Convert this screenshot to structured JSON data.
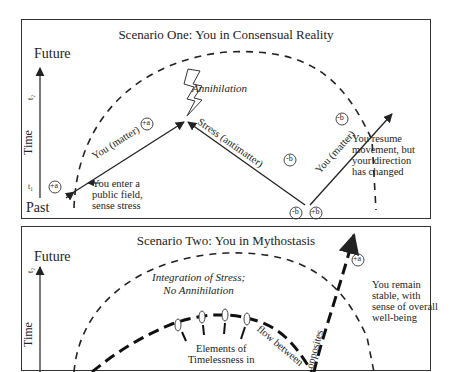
{
  "scenario_one": {
    "title": "Scenario One: You in Consensual Reality",
    "axis": {
      "top": "Future",
      "bottom": "Past",
      "label": "Time",
      "t1": "t₁",
      "t2": "t₂"
    },
    "labels": {
      "annihilation": "Annihilation",
      "you_matter_1": "You (matter)",
      "stress_antimatter": "Stress (antimatter)",
      "you_matter_2": "You (matter)",
      "plus_a": "+a",
      "minus_b": "-b",
      "plus_b": "+b"
    },
    "notes": {
      "enter": [
        "You enter a",
        "public field,",
        "sense stress"
      ],
      "resume": [
        "You resume",
        "movement, but",
        "your direction",
        "has changed"
      ]
    }
  },
  "scenario_two": {
    "title": "Scenario Two: You in Mythostasis",
    "axis": {
      "top": "Future",
      "label": "Time",
      "t2": "t₂"
    },
    "labels": {
      "integration": [
        "Integration of Stress;",
        "No Annihilation"
      ],
      "elements": [
        "Elements of",
        "Timelessness in"
      ],
      "flow_between": "flow between",
      "opposites": "opposites",
      "plus_a": "+a"
    },
    "notes": {
      "remain": [
        "You remain",
        "stable, with",
        "sense of overall",
        "well-being"
      ]
    }
  }
}
